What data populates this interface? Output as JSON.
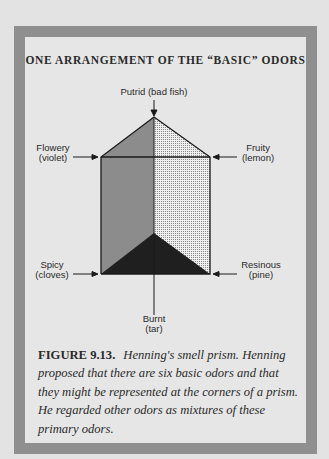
{
  "figure": {
    "title": "ONE ARRANGEMENT OF THE “BASIC” ODORS",
    "labels": {
      "putrid": "Putrid (bad fish)",
      "flowery_line1": "Flowery",
      "flowery_line2": "(violet)",
      "fruity_line1": "Fruity",
      "fruity_line2": "(lemon)",
      "spicy_line1": "Spicy",
      "spicy_line2": "(cloves)",
      "resinous_line1": "Resinous",
      "resinous_line2": "(pine)",
      "burnt_line1": "Burnt",
      "burnt_line2": "(tar)"
    },
    "caption": {
      "figure_number": "FIGURE 9.13.",
      "text": "Henning's smell prism. Henning proposed that there are six basic odors and that they might be represented at the corners of a prism. He regarded other odors as mixtures of these primary odors."
    },
    "colors": {
      "frame": "#8f8f8f",
      "panel": "#e6e6e6",
      "left_face": "#8c8c8c",
      "right_face_dots": "#c9c9c9",
      "bottom_triangle": "#1f1f1f",
      "line": "#1a1a1a"
    }
  }
}
